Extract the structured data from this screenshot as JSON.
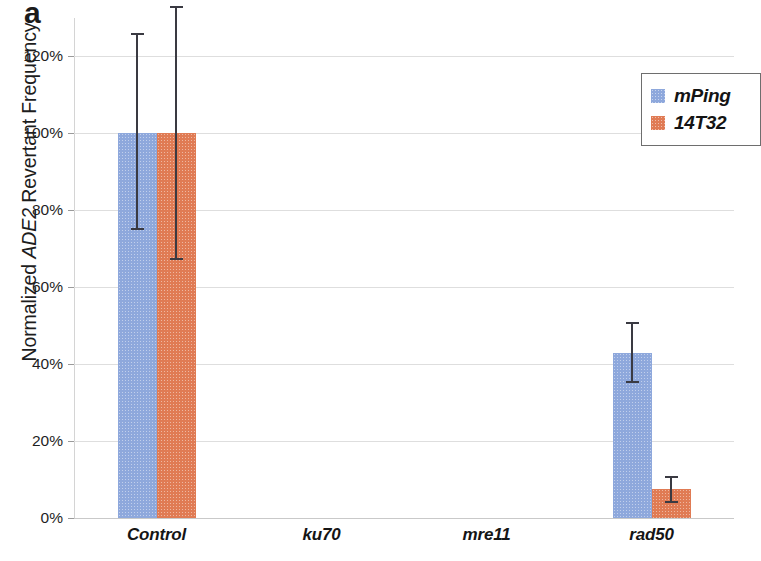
{
  "figure": {
    "panel_label": "a"
  },
  "chart_data": {
    "type": "bar",
    "title": "",
    "xlabel": "",
    "ylabel_prefix": "Normalized ",
    "ylabel_italic": "ADE2",
    "ylabel_suffix": " Revertant Frequency",
    "ylabel": "Normalized ADE2 Revertant Frequency",
    "categories": [
      "Control",
      "ku70",
      "mre11",
      "rad50"
    ],
    "ylim": [
      0,
      130
    ],
    "ytick_values": [
      0,
      20,
      40,
      60,
      80,
      100,
      120
    ],
    "ytick_labels": [
      "0%",
      "20%",
      "40%",
      "60%",
      "80%",
      "100%",
      "120%"
    ],
    "grid": true,
    "legend_position": "top-right",
    "series": [
      {
        "name": "mPing",
        "color": "#8EA8DC",
        "values": [
          100,
          0,
          0,
          43
        ],
        "error_low": [
          75,
          0,
          0,
          35
        ],
        "error_high": [
          126,
          0,
          0,
          51
        ]
      },
      {
        "name": "14T32",
        "color": "#E07B54",
        "values": [
          100,
          0,
          0,
          7.5
        ],
        "error_low": [
          67,
          0,
          0,
          4
        ],
        "error_high": [
          133,
          0,
          0,
          11
        ]
      }
    ]
  },
  "legend": {
    "items": [
      {
        "label": "mPing",
        "color": "#8EA8DC"
      },
      {
        "label": "14T32",
        "color": "#E07B54"
      }
    ]
  }
}
